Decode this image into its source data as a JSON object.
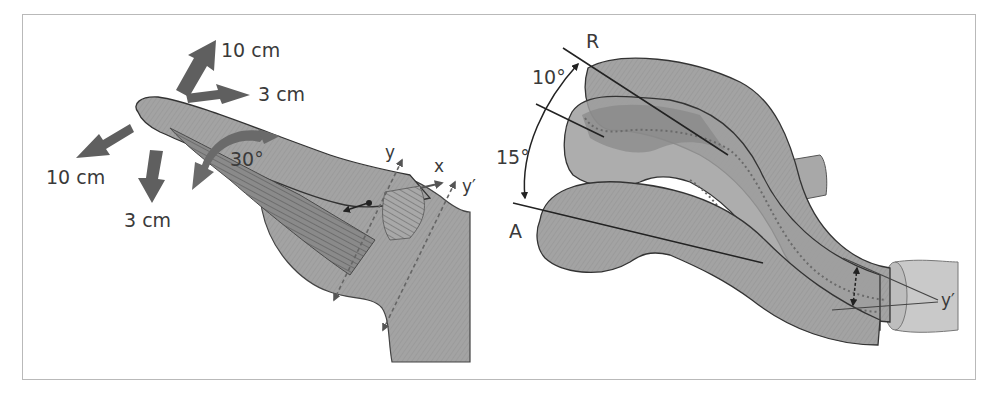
{
  "figure": {
    "left_panel": {
      "labels": {
        "up_arrow": "10 cm",
        "right_arrow": "3 cm",
        "left_down_arrow": "10 cm",
        "down_arrow": "3 cm",
        "rotation": "30°",
        "axis_y": "y",
        "axis_x": "x",
        "axis_y_prime": "y′"
      }
    },
    "right_panel": {
      "labels": {
        "retroversion": "R",
        "anteversion": "A",
        "angle_upper": "10°",
        "angle_lower": "15°",
        "axis_y_prime": "y′"
      }
    },
    "colors": {
      "bone_fill": "#9c9c9c",
      "bone_light": "#b4b4b4",
      "bone_dark": "#7e7e7e",
      "arrow": "#5f5f5f",
      "outline": "#3a3a3a",
      "frame": "#b9b9b9"
    }
  }
}
